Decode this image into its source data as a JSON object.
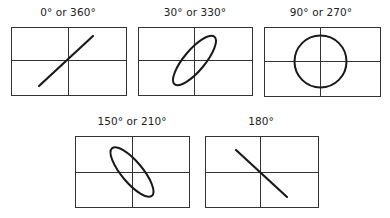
{
  "panels": [
    {
      "label": "0° or 360°",
      "shape": "line-positive-slope",
      "x": 11,
      "y": 27,
      "w": 115,
      "h": 68,
      "labelX": 68,
      "labelY": 12
    },
    {
      "label": "30° or 330°",
      "shape": "ellipse-positive-tilt",
      "x": 138,
      "y": 27,
      "w": 114,
      "h": 68,
      "labelX": 195,
      "labelY": 12
    },
    {
      "label": "90° or 270°",
      "shape": "circle",
      "x": 264,
      "y": 27,
      "w": 116,
      "h": 69,
      "labelX": 321,
      "labelY": 12
    },
    {
      "label": "150° or 210°",
      "shape": "ellipse-negative-tilt",
      "x": 75,
      "y": 136,
      "w": 114,
      "h": 71,
      "labelX": 132,
      "labelY": 121
    },
    {
      "label": "180°",
      "shape": "line-negative-slope",
      "x": 205,
      "y": 136,
      "w": 113,
      "h": 71,
      "labelX": 261,
      "labelY": 121
    }
  ],
  "colors": {
    "stroke": "#1a1a1a",
    "grid": "#333333",
    "text": "#222222"
  }
}
